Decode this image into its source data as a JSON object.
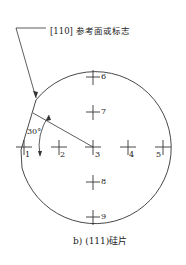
{
  "figure": {
    "reference_label": "[110] 参考面或标志",
    "angle_label": "30°",
    "caption": "b) (111)硅片",
    "points": [
      {
        "id": "1",
        "x": 24,
        "y": 147
      },
      {
        "id": "2",
        "x": 59,
        "y": 147
      },
      {
        "id": "3",
        "x": 93,
        "y": 147
      },
      {
        "id": "4",
        "x": 128,
        "y": 147
      },
      {
        "id": "5",
        "x": 163,
        "y": 147
      },
      {
        "id": "6",
        "x": 93,
        "y": 77
      },
      {
        "id": "7",
        "x": 93,
        "y": 112
      },
      {
        "id": "8",
        "x": 93,
        "y": 182
      },
      {
        "id": "9",
        "x": 93,
        "y": 217
      }
    ],
    "colors": {
      "line": "#333333"
    }
  }
}
